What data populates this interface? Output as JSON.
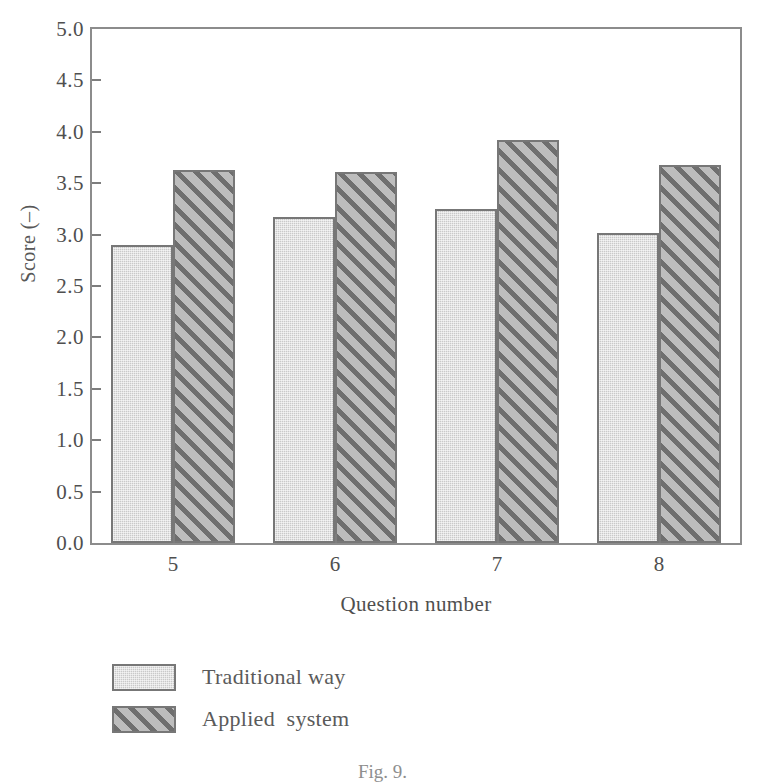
{
  "chart_data": {
    "type": "bar",
    "title": "",
    "xlabel": "Question number",
    "ylabel": "Score (–)",
    "categories": [
      "5",
      "6",
      "7",
      "8"
    ],
    "series": [
      {
        "name": "Traditional way",
        "values": [
          2.9,
          3.17,
          3.25,
          3.02
        ],
        "style": "solid-gray"
      },
      {
        "name": "Applied  system",
        "values": [
          3.63,
          3.61,
          3.92,
          3.68
        ],
        "style": "diagonal-hatch"
      }
    ],
    "ylim": [
      0.0,
      5.0
    ],
    "ytick_labels": [
      "0.0",
      "0.5",
      "1.0",
      "1.5",
      "2.0",
      "2.5",
      "3.0",
      "3.5",
      "4.0",
      "4.5",
      "5.0"
    ],
    "ytick_values": [
      0.0,
      0.5,
      1.0,
      1.5,
      2.0,
      2.5,
      3.0,
      3.5,
      4.0,
      4.5,
      5.0
    ],
    "grid": false,
    "legend_position": "below-axes-left",
    "frame": "full-box"
  },
  "legend": {
    "entries": [
      {
        "label": "Traditional way",
        "swatch": "solid-gray-swatch"
      },
      {
        "label": "Applied  system",
        "swatch": "hatched-swatch"
      }
    ]
  },
  "caption": "Fig. 9.",
  "colors": {
    "solid_fill": "#c9c9c9",
    "hatch_fill": "#bdbdbd",
    "hatch_line": "#6f6f6f",
    "bar_border": "#777777",
    "axis": "#8c8c8c",
    "text": "#4f4f4f",
    "background": "#ffffff"
  }
}
